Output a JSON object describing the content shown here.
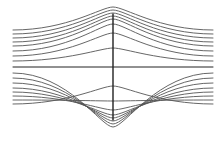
{
  "diagram": {
    "type": "streamlines",
    "stroke_color": "#555555",
    "axis_color": "#222222",
    "center_x": 113,
    "center_y": 67,
    "left_x": 13,
    "right_x": 213,
    "vertical_segment": {
      "y_top": 14,
      "y_bottom": 120
    },
    "upper_lines_left_y": [
      30,
      34,
      38,
      42,
      46,
      51,
      56,
      61
    ],
    "upper_lines_peak_y": [
      7,
      10,
      13,
      16,
      19,
      24,
      33,
      48
    ],
    "lower_lines_left_y": [
      73,
      78,
      83,
      88,
      92,
      96,
      100,
      104
    ],
    "lower_lines_peak_y": [
      86,
      101,
      110,
      115,
      118,
      121,
      124,
      127
    ]
  }
}
